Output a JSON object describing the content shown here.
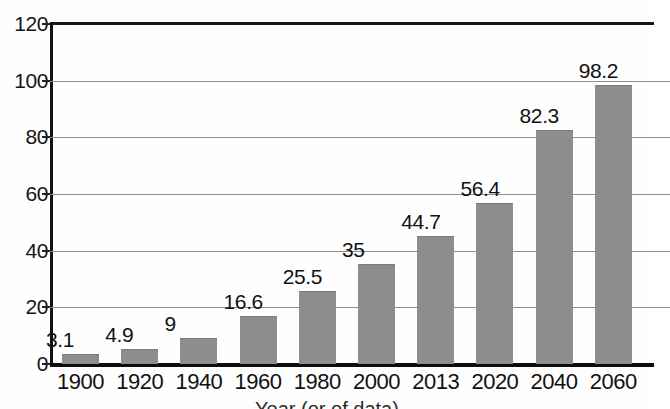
{
  "chart_data": {
    "type": "bar",
    "title": "",
    "xlabel": "Year (or of data)",
    "ylabel": "",
    "categories": [
      "1900",
      "1920",
      "1940",
      "1960",
      "1980",
      "2000",
      "2013",
      "2020",
      "2040",
      "2060"
    ],
    "values": [
      3.1,
      4.9,
      9,
      16.6,
      25.5,
      35,
      44.7,
      56.4,
      82.3,
      98.2
    ],
    "value_labels": [
      "3.1",
      "4.9",
      "9",
      "16.6",
      "25.5",
      "35",
      "44.7",
      "56.4",
      "82.3",
      "98.2"
    ],
    "ylim": [
      0,
      120
    ],
    "y_ticks": [
      0,
      20,
      40,
      60,
      80,
      100,
      120
    ],
    "y_tick_labels": [
      "0",
      "20",
      "40",
      "60",
      "80",
      "100",
      "120"
    ],
    "grid": true,
    "legend": "none",
    "series": [
      {
        "name": "",
        "values": [
          3.1,
          4.9,
          9,
          16.6,
          25.5,
          35,
          44.7,
          56.4,
          82.3,
          98.2
        ]
      }
    ],
    "bar_color": "#8d8d8d",
    "axis_color": "#111111",
    "gridline_color": "#8f8f8f",
    "background_color": "#ffffff"
  }
}
